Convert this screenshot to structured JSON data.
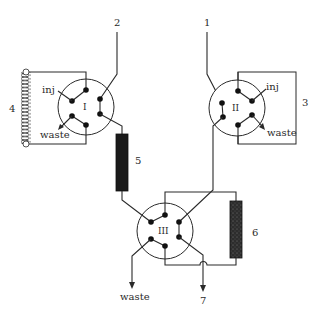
{
  "diagram": {
    "type": "HPLC column-switching valve schematic",
    "inputs": [
      {
        "id": "inlet-1",
        "label": "1"
      },
      {
        "id": "inlet-2",
        "label": "2"
      }
    ],
    "valves": [
      {
        "id": "valve-I",
        "label": "I",
        "port_labels": {
          "inj": "inj",
          "waste": "waste"
        }
      },
      {
        "id": "valve-II",
        "label": "II",
        "port_labels": {
          "inj": "inj",
          "waste": "waste"
        }
      },
      {
        "id": "valve-III",
        "label": "III"
      }
    ],
    "components": [
      {
        "id": "sample-loop-3",
        "label": "3",
        "kind": "loop"
      },
      {
        "id": "coil-4",
        "label": "4",
        "kind": "coiled loop"
      },
      {
        "id": "column-5",
        "label": "5",
        "kind": "column"
      },
      {
        "id": "column-6",
        "label": "6",
        "kind": "column"
      }
    ],
    "outputs": [
      {
        "id": "waste-out",
        "label": "waste"
      },
      {
        "id": "outlet-7",
        "label": "7"
      }
    ],
    "colors": {
      "line": "#2a2a2a",
      "port": "#111111",
      "column5": "#1a1a1a",
      "column6": "#3a3a3a",
      "background": "#ffffff"
    }
  }
}
